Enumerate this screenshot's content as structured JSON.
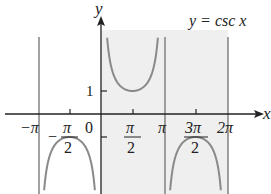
{
  "chart_data": {
    "type": "line",
    "title": "y = csc x",
    "function": "csc x",
    "xlabel": "x",
    "ylabel": "y",
    "x_ticks": [
      {
        "value": -3.14159,
        "label": "−π"
      },
      {
        "value": -1.5708,
        "label": "−π/2"
      },
      {
        "value": 0,
        "label": "0"
      },
      {
        "value": 1.5708,
        "label": "π/2"
      },
      {
        "value": 3.14159,
        "label": "π"
      },
      {
        "value": 4.71239,
        "label": "3π/2"
      },
      {
        "value": 6.28319,
        "label": "2π"
      }
    ],
    "y_ticks": [
      {
        "value": 1,
        "label": "1"
      }
    ],
    "asymptotes_x": [
      -3.14159,
      0,
      3.14159,
      6.28319
    ],
    "shaded_interval": [
      0,
      6.28319
    ],
    "local_extrema": [
      {
        "x": -1.5708,
        "y": -1
      },
      {
        "x": 1.5708,
        "y": 1
      },
      {
        "x": 4.71239,
        "y": -1
      }
    ],
    "xlim": [
      -3.3,
      6.9
    ],
    "ylim": [
      -3.5,
      4.6
    ],
    "grid": false,
    "legend": "none",
    "colors": {
      "curve": "#8a8a8a",
      "asymptote": "#777777",
      "shade": "#efefef",
      "axis": "#222222"
    }
  },
  "labels": {
    "title": "y = csc x",
    "x_axis": "x",
    "y_axis": "y",
    "tick_neg_pi": "−π",
    "tick_neg_pi_2_num": "π",
    "tick_neg_pi_2_den": "2",
    "tick_zero": "0",
    "tick_pi_2_num": "π",
    "tick_pi_2_den": "2",
    "tick_pi": "π",
    "tick_3pi_2_num": "3π",
    "tick_3pi_2_den": "2",
    "tick_2pi": "2π",
    "y_tick_one": "1"
  }
}
